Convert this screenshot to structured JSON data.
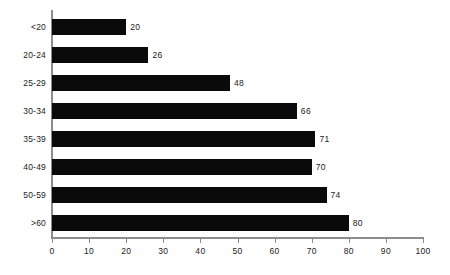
{
  "chart_data": {
    "type": "bar",
    "orientation": "horizontal",
    "title": "",
    "subtitle": "",
    "xlabel": "",
    "ylabel": "",
    "categories": [
      "<20",
      "20-24",
      "25-29",
      "30-34",
      "35-39",
      "40-49",
      "50-59",
      ">60"
    ],
    "values": [
      20,
      26,
      48,
      66,
      71,
      70,
      74,
      80
    ],
    "data_labels": [
      "20",
      "26",
      "48",
      "66",
      "71",
      "70",
      "74",
      "80"
    ],
    "xlim": [
      0,
      100
    ],
    "xticks": [
      0,
      10,
      20,
      30,
      40,
      50,
      60,
      70,
      80,
      90,
      100
    ],
    "xtick_labels": [
      "0",
      "10",
      "20",
      "30",
      "40",
      "50",
      "60",
      "70",
      "80",
      "90",
      "100"
    ],
    "grid": false,
    "legend": false,
    "legend_position": "none",
    "bar_color": "#0a0a0a",
    "axis_color": "#8c8c8c",
    "background_color": "#ffffff",
    "text_color": "#1a1a1a"
  }
}
